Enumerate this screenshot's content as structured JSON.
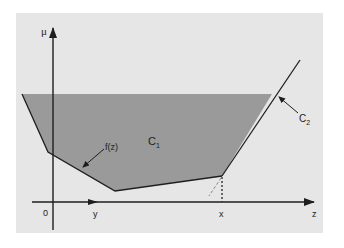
{
  "figure": {
    "colors": {
      "page_bg": "#ffffff",
      "panel_bg": "#e6e6e6",
      "region_fill": "#9a9a9a",
      "line": "#1e1e1e",
      "dashed": "#777777"
    },
    "panel": {
      "x": 16,
      "y": 13,
      "width": 307,
      "height": 220
    },
    "axes": {
      "vertical": {
        "label": "μ",
        "x": 53,
        "y_top": 24,
        "y_bottom": 230
      },
      "horizontal": {
        "label": "z",
        "y": 202,
        "x_left": 32,
        "x_right": 318
      }
    },
    "tick_labels": {
      "origin": "0",
      "y": "y",
      "x": "x",
      "z": "z"
    },
    "region": {
      "name": "C",
      "subscript": "1",
      "top_y": 94
    },
    "curve_label": "f(z)",
    "line_label": {
      "name": "C",
      "subscript": "2"
    },
    "vertices": [
      [
        22,
        94
      ],
      [
        48,
        152
      ],
      [
        115,
        191
      ],
      [
        222,
        176
      ],
      [
        272,
        94
      ],
      [
        300,
        60
      ]
    ]
  }
}
